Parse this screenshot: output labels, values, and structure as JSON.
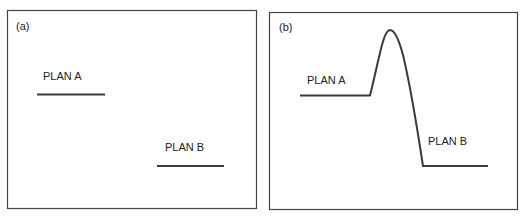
{
  "panels": [
    {
      "id": "a",
      "label": "(a)",
      "plan_a": {
        "label": "PLAN A"
      },
      "plan_b": {
        "label": "PLAN B"
      }
    },
    {
      "id": "b",
      "label": "(b)",
      "plan_a": {
        "label": "PLAN A"
      },
      "plan_b": {
        "label": "PLAN B"
      }
    }
  ],
  "colors": {
    "line": "#3a3a3a",
    "frame": "#444444",
    "background": "#ffffff"
  }
}
